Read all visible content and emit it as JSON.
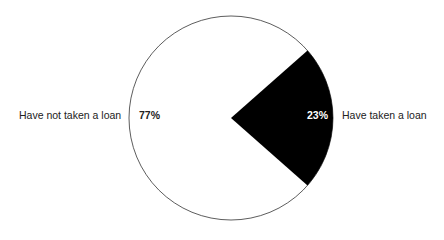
{
  "chart_data": {
    "type": "pie",
    "title": "",
    "categories": [
      "Have taken a loan",
      "Have not taken a loan"
    ],
    "values": [
      23,
      77
    ],
    "value_labels": [
      "23%",
      "77%"
    ],
    "colors": [
      "#000000",
      "#ffffff"
    ],
    "outline_color": "#333333",
    "legend": "none (direct labels outside slices)"
  },
  "labels": {
    "taken": "Have taken a loan",
    "not_taken": "Have not taken a loan",
    "taken_pct": "23%",
    "not_taken_pct": "77%"
  }
}
